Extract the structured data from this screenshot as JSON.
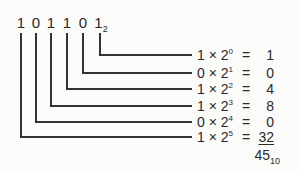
{
  "binary_number": {
    "digits": [
      "1",
      "0",
      "1",
      "1",
      "0",
      "1"
    ],
    "base": "2"
  },
  "rows": [
    {
      "bit": "1",
      "base": "2",
      "exp": "0",
      "times": "×",
      "eq": "=",
      "value": "1"
    },
    {
      "bit": "0",
      "base": "2",
      "exp": "1",
      "times": "×",
      "eq": "=",
      "value": "0"
    },
    {
      "bit": "1",
      "base": "2",
      "exp": "2",
      "times": "×",
      "eq": "=",
      "value": "4"
    },
    {
      "bit": "1",
      "base": "2",
      "exp": "3",
      "times": "×",
      "eq": "=",
      "value": "8"
    },
    {
      "bit": "0",
      "base": "2",
      "exp": "4",
      "times": "×",
      "eq": "=",
      "value": "0"
    },
    {
      "bit": "1",
      "base": "2",
      "exp": "5",
      "times": "×",
      "eq": "=",
      "value": "32"
    }
  ],
  "result": {
    "value": "45",
    "base": "10"
  },
  "colors": {
    "line": "#333333",
    "text": "#2a2a2a",
    "background": "#fbfbfa"
  }
}
